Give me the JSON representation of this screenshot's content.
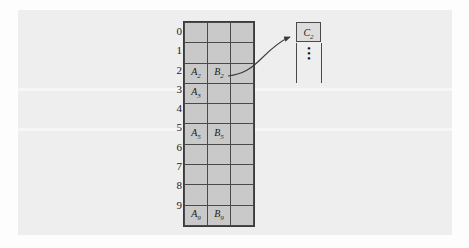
{
  "figure": {
    "kind": "hash-table-with-overflow-chain",
    "panel_bg": "#eeeeee",
    "cell_bg": "#c9c9c9",
    "line_color": "#4a4a4a",
    "row_indices": [
      "0",
      "1",
      "2",
      "3",
      "4",
      "5",
      "6",
      "7",
      "8",
      "9"
    ],
    "columns": 3,
    "rows": [
      {
        "index": "0",
        "cells": [
          "",
          "",
          ""
        ]
      },
      {
        "index": "1",
        "cells": [
          "",
          "",
          ""
        ]
      },
      {
        "index": "2",
        "cells": [
          "A2",
          "B2",
          ""
        ]
      },
      {
        "index": "3",
        "cells": [
          "A3",
          "",
          ""
        ]
      },
      {
        "index": "4",
        "cells": [
          "",
          "",
          ""
        ]
      },
      {
        "index": "5",
        "cells": [
          "A5",
          "B5",
          ""
        ]
      },
      {
        "index": "6",
        "cells": [
          "",
          "",
          ""
        ]
      },
      {
        "index": "7",
        "cells": [
          "",
          "",
          ""
        ]
      },
      {
        "index": "8",
        "cells": [
          "",
          "",
          ""
        ]
      },
      {
        "index": "9",
        "cells": [
          "A9",
          "B9",
          ""
        ]
      }
    ],
    "cell_labels": {
      "r2c1_base": "A",
      "r2c1_sub": "2",
      "r2c2_base": "B",
      "r2c2_sub": "2",
      "r3c1_base": "A",
      "r3c1_sub": "3",
      "r5c1_base": "A",
      "r5c1_sub": "5",
      "r5c2_base": "B",
      "r5c2_sub": "5",
      "r9c1_base": "A",
      "r9c1_sub": "9",
      "r9c2_base": "B",
      "r9c2_sub": "9"
    },
    "overflow_node": {
      "base": "C",
      "sub": "2",
      "continuation": "vertical-ellipsis",
      "dot": "•"
    },
    "arrow": {
      "from_row": "2",
      "from_column": "3",
      "to": "overflow-node",
      "style": "curved-with-arrowhead"
    }
  }
}
